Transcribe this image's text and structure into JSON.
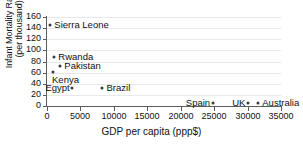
{
  "chart_data": {
    "type": "scatter",
    "title": "",
    "xlabel": "GDP per capita (ppp$)",
    "ylabel": "Infant Mortality Rate (per thousand)",
    "ylabel_line1": "Infant Mortality Rate",
    "ylabel_line2": "(per thousand)",
    "xlim": [
      0,
      35000
    ],
    "ylim": [
      0,
      160
    ],
    "xticks": [
      0,
      5000,
      10000,
      15000,
      20000,
      25000,
      30000,
      35000
    ],
    "xtick_labels": [
      "0",
      "5000",
      "10000",
      "15000",
      "20000",
      "25000",
      "30000",
      "35000"
    ],
    "yticks": [
      0,
      20,
      40,
      60,
      80,
      100,
      120,
      140,
      160
    ],
    "ytick_labels": [
      "0",
      "20",
      "40",
      "60",
      "80",
      "100",
      "120",
      "140",
      "160"
    ],
    "grid": "horizontal",
    "legend": "none",
    "marker_color": "#3b3b3b",
    "axis_color": "#5d5d5d",
    "grid_color": "#e9e9e9",
    "points": [
      {
        "name": "Sierra Leone",
        "x": 500,
        "y": 145,
        "label_side": "right"
      },
      {
        "name": "Rwanda",
        "x": 1100,
        "y": 88,
        "label_side": "right"
      },
      {
        "name": "Pakistan",
        "x": 2000,
        "y": 72,
        "label_side": "right"
      },
      {
        "name": "Kenya",
        "x": 900,
        "y": 62,
        "label_side": "below"
      },
      {
        "name": "Egypt",
        "x": 3800,
        "y": 32,
        "label_side": "left"
      },
      {
        "name": "Brazil",
        "x": 8300,
        "y": 32,
        "label_side": "right"
      },
      {
        "name": "Spain",
        "x": 24800,
        "y": 6,
        "label_side": "left"
      },
      {
        "name": "UK",
        "x": 30100,
        "y": 6,
        "label_side": "left"
      },
      {
        "name": "Australia",
        "x": 31600,
        "y": 6,
        "label_side": "right"
      }
    ]
  }
}
